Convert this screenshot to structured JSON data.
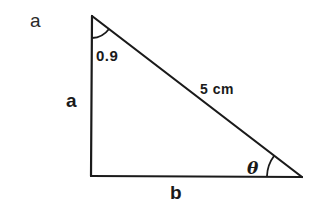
{
  "figure": {
    "panel_label": "a",
    "shape": "right-triangle",
    "vertices": {
      "top": [
        92,
        16
      ],
      "right_angle": [
        91,
        176
      ],
      "right": [
        302,
        177
      ]
    },
    "labels": {
      "top_angle": "0.9",
      "vertical_side": "a",
      "hypotenuse": "5 cm",
      "bottom_angle": "θ",
      "horizontal_side": "b"
    },
    "colors": {
      "line": "#1a1a1a",
      "background": "#ffffff"
    }
  }
}
